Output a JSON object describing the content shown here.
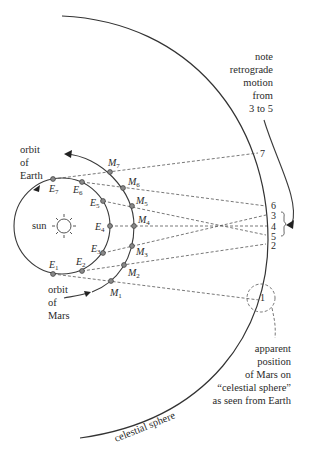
{
  "figure": {
    "labels": {
      "sun": "sun",
      "orbit_earth": [
        "orbit",
        "of",
        "Earth"
      ],
      "orbit_mars": [
        "orbit",
        "of",
        "Mars"
      ],
      "celestial_sphere": "celestial sphere",
      "note": [
        "note",
        "retrograde",
        "motion",
        "from",
        "3 to 5"
      ],
      "apparent": [
        "apparent",
        "position",
        "of Mars on",
        "“celestial sphere”",
        "as seen from Earth"
      ]
    },
    "earth_points": [
      {
        "id": "E1",
        "base": "E",
        "sub": "1"
      },
      {
        "id": "E2",
        "base": "E",
        "sub": "2"
      },
      {
        "id": "E3",
        "base": "E",
        "sub": "3"
      },
      {
        "id": "E4",
        "base": "E",
        "sub": "4"
      },
      {
        "id": "E5",
        "base": "E",
        "sub": "5"
      },
      {
        "id": "E6",
        "base": "E",
        "sub": "6"
      },
      {
        "id": "E7",
        "base": "E",
        "sub": "7"
      }
    ],
    "mars_points": [
      {
        "id": "M1",
        "base": "M",
        "sub": "1"
      },
      {
        "id": "M2",
        "base": "M",
        "sub": "2"
      },
      {
        "id": "M3",
        "base": "M",
        "sub": "3"
      },
      {
        "id": "M4",
        "base": "M",
        "sub": "4"
      },
      {
        "id": "M5",
        "base": "M",
        "sub": "5"
      },
      {
        "id": "M6",
        "base": "M",
        "sub": "6"
      },
      {
        "id": "M7",
        "base": "M",
        "sub": "7"
      }
    ],
    "sphere_positions": [
      "1",
      "2",
      "3",
      "4",
      "5",
      "6",
      "7"
    ]
  }
}
